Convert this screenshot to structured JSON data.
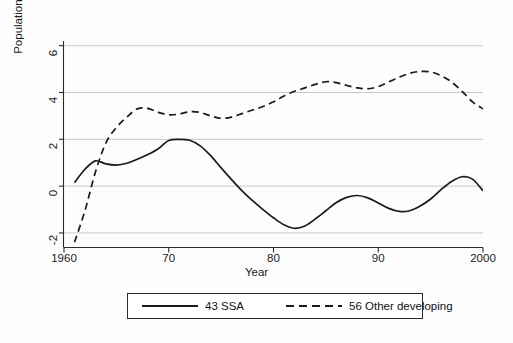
{
  "chart_data": {
    "type": "line",
    "title": "",
    "xlabel": "Year",
    "ylabel": "Population-weighted average, %",
    "xlim": [
      1960,
      2000
    ],
    "ylim": [
      -2.6,
      6.2
    ],
    "grid": true,
    "grid_axis": "y",
    "legend_position": "bottom-outside",
    "xticks": [
      1960,
      1970,
      1980,
      1990,
      2000
    ],
    "xtick_labels": [
      "1960",
      "70",
      "80",
      "90",
      "2000"
    ],
    "yticks": [
      -2,
      0,
      2,
      4,
      6
    ],
    "ytick_labels": [
      "-2",
      "0",
      "2",
      "4",
      "6"
    ],
    "x": [
      1961,
      1962,
      1963,
      1964,
      1965,
      1966,
      1967,
      1968,
      1969,
      1970,
      1971,
      1972,
      1973,
      1974,
      1975,
      1976,
      1977,
      1978,
      1979,
      1980,
      1981,
      1982,
      1983,
      1984,
      1985,
      1986,
      1987,
      1988,
      1989,
      1990,
      1991,
      1992,
      1993,
      1994,
      1995,
      1996,
      1997,
      1998,
      1999,
      2000
    ],
    "series": [
      {
        "name": "43 SSA",
        "style": "solid",
        "color": "#1a1a1a",
        "values": [
          0.15,
          0.72,
          1.08,
          0.95,
          0.9,
          0.98,
          1.15,
          1.35,
          1.6,
          1.95,
          2.0,
          1.96,
          1.72,
          1.3,
          0.78,
          0.28,
          -0.2,
          -0.62,
          -1.0,
          -1.35,
          -1.65,
          -1.8,
          -1.7,
          -1.4,
          -1.05,
          -0.7,
          -0.48,
          -0.4,
          -0.5,
          -0.72,
          -0.95,
          -1.08,
          -1.05,
          -0.85,
          -0.55,
          -0.15,
          0.2,
          0.4,
          0.3,
          -0.2
        ]
      },
      {
        "name": "56 Other developing",
        "style": "dashed",
        "color": "#1a1a1a",
        "values": [
          -2.4,
          -1.05,
          0.6,
          1.85,
          2.5,
          2.95,
          3.3,
          3.32,
          3.15,
          3.05,
          3.08,
          3.18,
          3.15,
          3.0,
          2.9,
          2.95,
          3.1,
          3.25,
          3.4,
          3.6,
          3.85,
          4.05,
          4.2,
          4.35,
          4.46,
          4.42,
          4.3,
          4.2,
          4.16,
          4.25,
          4.45,
          4.65,
          4.82,
          4.9,
          4.88,
          4.72,
          4.45,
          4.05,
          3.6,
          3.3
        ]
      }
    ]
  },
  "axes": {
    "ylabel": "Population-weighted average, %",
    "xlabel": "Year"
  },
  "legend": {
    "items": [
      {
        "label": "43 SSA",
        "style": "solid"
      },
      {
        "label": "56 Other developing",
        "style": "dashed"
      }
    ]
  }
}
